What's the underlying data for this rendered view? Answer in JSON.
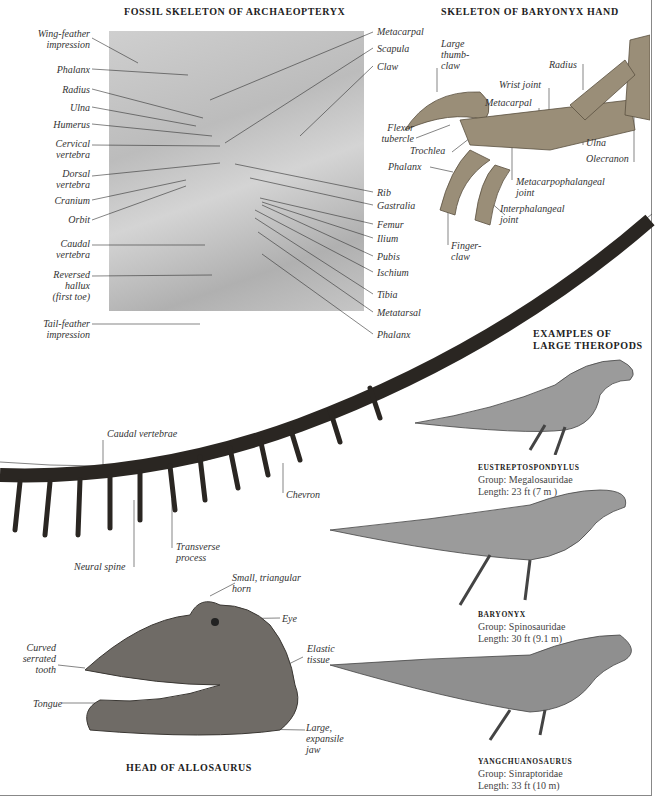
{
  "archaeopteryx": {
    "title": "FOSSIL SKELETON OF ARCHAEOPTERYX",
    "left_labels": [
      {
        "l1": "Wing-feather",
        "l2": "impression"
      },
      {
        "l1": "Phalanx"
      },
      {
        "l1": "Radius"
      },
      {
        "l1": "Ulna"
      },
      {
        "l1": "Humerus"
      },
      {
        "l1": "Cervical",
        "l2": "vertebra"
      },
      {
        "l1": "Dorsal",
        "l2": "vertebra"
      },
      {
        "l1": "Cranium"
      },
      {
        "l1": "Orbit"
      },
      {
        "l1": "Caudal",
        "l2": "vertebra"
      },
      {
        "l1": "Reversed",
        "l2": "hallux",
        "l3": "(first toe)"
      },
      {
        "l1": "Tail-feather",
        "l2": "impression"
      }
    ],
    "right_labels": [
      "Metacarpal",
      "Scapula",
      "Claw",
      "Rib",
      "Gastralia",
      "Femur",
      "Ilium",
      "Pubis",
      "Ischium",
      "Tibia",
      "Metatarsal",
      "Phalanx"
    ]
  },
  "baryonyx_hand": {
    "title": "SKELETON OF BARYONYX HAND",
    "labels": {
      "thumb_claw": [
        "Large",
        "thumb-",
        "claw"
      ],
      "flexor": [
        "Flexor",
        "tubercle"
      ],
      "trochlea": "Trochlea",
      "phalanx": "Phalanx",
      "finger_claw": [
        "Finger-",
        "claw"
      ],
      "interphalangeal": [
        "Interphalangeal",
        "joint"
      ],
      "metacarpophalangeal": [
        "Metacarpophalangeal",
        "joint"
      ],
      "metacarpal": "Metacarpal",
      "wrist": "Wrist joint",
      "radius": "Radius",
      "ulna": "Ulna",
      "olecranon": "Olecranon"
    }
  },
  "tail": {
    "caudal_vertebrae": "Caudal vertebrae",
    "chevron": "Chevron",
    "transverse": [
      "Transverse",
      "process"
    ],
    "neural_spine": "Neural spine"
  },
  "allosaurus": {
    "title": "HEAD OF ALLOSAURUS",
    "horn": [
      "Small, triangular",
      "horn"
    ],
    "eye": "Eye",
    "tooth": [
      "Curved",
      "serrated",
      "tooth"
    ],
    "elastic": [
      "Elastic",
      "tissue"
    ],
    "tongue": "Tongue",
    "jaw": [
      "Large,",
      "expansile",
      "jaw"
    ]
  },
  "theropods": {
    "title_l1": "EXAMPLES OF",
    "title_l2": "LARGE THEROPODS",
    "items": [
      {
        "name": "EUSTREPTOSPONDYLUS",
        "group": "Group: Megalosauridae",
        "length": "Length: 23 ft (7 m )"
      },
      {
        "name": "BARYONYX",
        "group": "Group: Spinosauridae",
        "length": "Length: 30 ft (9.1 m)"
      },
      {
        "name": "YANGCHUANOSAURUS",
        "group": "Group: Sinraptoridae",
        "length": "Length: 33 ft (10 m)"
      }
    ]
  },
  "colors": {
    "text": "#333333",
    "fossil": "#c4c4c4",
    "bone": "#2a2622",
    "border": "#888888"
  }
}
